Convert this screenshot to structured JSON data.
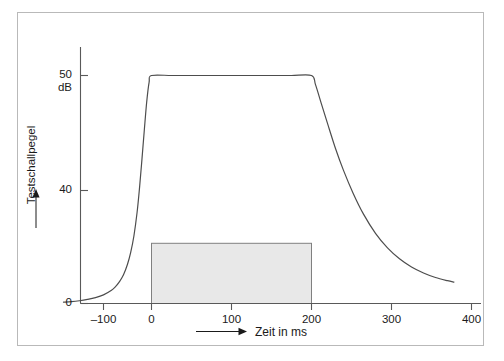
{
  "chart_data": {
    "type": "line",
    "title": "",
    "subtitle": "",
    "xlabel": "Zeit in ms",
    "ylabel": "Testschallpegel",
    "yunit": "dB",
    "xlim": [
      -130,
      415
    ],
    "ylim": [
      0,
      54
    ],
    "grid": false,
    "legend": null,
    "xticks": [
      -100,
      0,
      100,
      200,
      300,
      400
    ],
    "xticklabels": [
      "–100",
      "0",
      "100",
      "200",
      "300",
      "400"
    ],
    "yticks": [
      0,
      40,
      50
    ],
    "yticklabels": [
      "0",
      "40",
      "50"
    ],
    "ytick_unit_label": "dB",
    "series": [
      {
        "name": "Testschallpegel",
        "color": "#4d4d4d",
        "comment": "exponential rise from baseline to 50 dB plateau, flat 0-200 ms, exponential decay after 200 ms",
        "x": [
          -110,
          -100,
          -90,
          -80,
          -70,
          -60,
          -50,
          -45,
          -40,
          -35,
          -30,
          -26,
          -22,
          -18,
          -15,
          -12,
          -9,
          -6,
          -3,
          0,
          25,
          50,
          75,
          100,
          125,
          150,
          175,
          200,
          205,
          212,
          220,
          230,
          240,
          252,
          265,
          280,
          295,
          310,
          325,
          340,
          355,
          370,
          378
        ],
        "y": [
          0.3,
          0.4,
          0.6,
          0.9,
          1.3,
          1.9,
          2.9,
          3.7,
          4.8,
          6.3,
          8.6,
          11.2,
          14.8,
          20.0,
          25.3,
          31.5,
          38.0,
          44.2,
          48.5,
          50.0,
          50.0,
          50.0,
          50.0,
          50.0,
          50.0,
          50.0,
          50.0,
          50.0,
          48.0,
          44.0,
          39.5,
          34.0,
          29.2,
          24.2,
          19.6,
          15.4,
          12.2,
          9.8,
          8.0,
          6.7,
          5.7,
          5.0,
          4.7
        ]
      }
    ],
    "annotations": [
      {
        "kind": "shaded-rectangle",
        "name": "measurement-window",
        "x_start": 0,
        "x_end": 200,
        "y_start": 0,
        "y_end": 13.2,
        "fill": "#e8e8e8",
        "stroke": "#808080"
      }
    ],
    "axis_arrows": {
      "x": "right",
      "y": "up"
    }
  },
  "figure": {
    "frame_color": "#b9b9b9",
    "axis_color": "#595959",
    "curve_color": "#4d4d4d",
    "text_color": "#1a1a1a",
    "background": "#ffffff"
  }
}
